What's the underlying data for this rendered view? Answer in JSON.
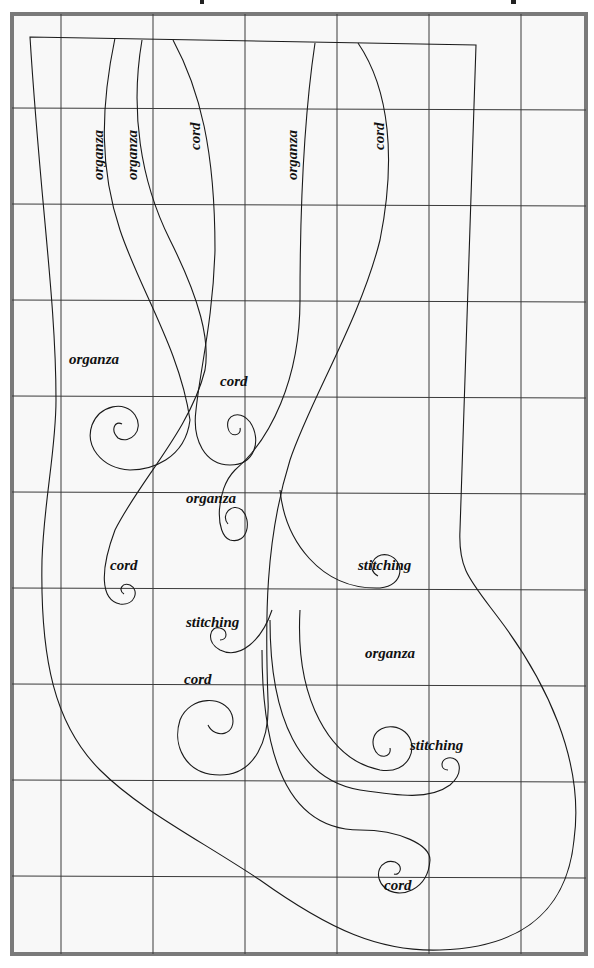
{
  "diagram": {
    "background_color": "#f8f8f8",
    "frame_color": "#7a7a7a",
    "line_color": "#1a1a1a",
    "grid": {
      "columns": 6,
      "rows": 10
    },
    "vertical_labels": [
      {
        "id": "v1",
        "text": "organza"
      },
      {
        "id": "v2",
        "text": "organza"
      },
      {
        "id": "v3",
        "text": "cord"
      },
      {
        "id": "v4",
        "text": "organza"
      },
      {
        "id": "v5",
        "text": "cord"
      }
    ],
    "spiral_labels": [
      {
        "id": "s1",
        "text": "organza"
      },
      {
        "id": "s2",
        "text": "cord"
      },
      {
        "id": "s3",
        "text": "organza"
      },
      {
        "id": "s4",
        "text": "cord"
      },
      {
        "id": "s5",
        "text": "stitching"
      },
      {
        "id": "s6",
        "text": "stitching"
      },
      {
        "id": "s7",
        "text": "cord"
      },
      {
        "id": "s8",
        "text": "organza"
      },
      {
        "id": "s9",
        "text": "stitching"
      },
      {
        "id": "s10",
        "text": "cord"
      }
    ]
  }
}
